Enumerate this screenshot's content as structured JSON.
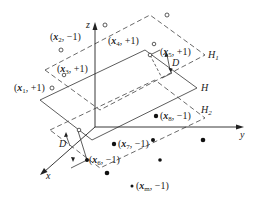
{
  "diagram": {
    "type": "svm-hyperplanes-3d",
    "axes": {
      "x": "x",
      "y": "y",
      "z": "z"
    },
    "planes": {
      "H1": {
        "name": "H",
        "sub": "1",
        "style": "dashed"
      },
      "H": {
        "name": "H",
        "sub": "",
        "style": "solid"
      },
      "H2": {
        "name": "H",
        "sub": "2",
        "style": "dashed"
      }
    },
    "margin_labels": {
      "upper": "D",
      "lower": "D"
    },
    "points": [
      {
        "id": "x1",
        "var": "x",
        "sub": "1",
        "label": "+1",
        "class": "positive",
        "marker": "hollow"
      },
      {
        "id": "x2",
        "var": "x",
        "sub": "2",
        "label": "−1",
        "class": "positive",
        "marker": "hollow"
      },
      {
        "id": "x3",
        "var": "x",
        "sub": "3",
        "label": "+1",
        "class": "positive",
        "marker": "hollow"
      },
      {
        "id": "x4",
        "var": "x",
        "sub": "4",
        "label": "+1",
        "class": "positive",
        "marker": "hollow"
      },
      {
        "id": "x5",
        "var": "x",
        "sub": "5",
        "label": "+1",
        "class": "positive",
        "marker": "hollow"
      },
      {
        "id": "x6",
        "var": "x",
        "sub": "6",
        "label": "−1",
        "class": "negative",
        "marker": "solid"
      },
      {
        "id": "x7",
        "var": "x",
        "sub": "7",
        "label": "−1",
        "class": "negative",
        "marker": "solid"
      },
      {
        "id": "x8",
        "var": "x",
        "sub": "8",
        "label": "−1",
        "class": "negative",
        "marker": "solid"
      },
      {
        "id": "xm",
        "var": "x",
        "sub": "m",
        "label": "−1",
        "class": "negative",
        "marker": "solid"
      }
    ]
  }
}
